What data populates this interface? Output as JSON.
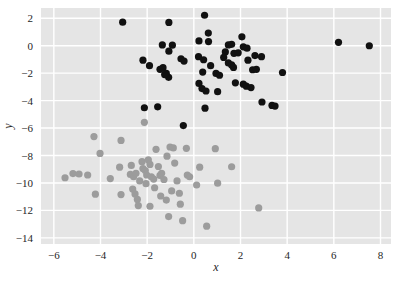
{
  "chart_data": {
    "type": "scatter",
    "title": "",
    "xlabel": "x",
    "ylabel": "y",
    "xlim": [
      -6.55,
      8.45
    ],
    "ylim": [
      -14.45,
      2.75
    ],
    "xticks": [
      -6,
      -4,
      -2,
      0,
      2,
      4,
      6,
      8
    ],
    "xticklabels": [
      "−6",
      "−4",
      "−2",
      "0",
      "2",
      "4",
      "6",
      "8"
    ],
    "yticks": [
      2,
      0,
      -2,
      -4,
      -6,
      -8,
      -10,
      -12,
      -14
    ],
    "yticklabels": [
      "2",
      "0",
      "−2",
      "−4",
      "−6",
      "−8",
      "−10",
      "−12",
      "−14"
    ],
    "grid": true,
    "grid_color": "#ffffff",
    "axes_facecolor": "#e5e5e5",
    "figure_facecolor": "#ffffff",
    "legend": null,
    "marker_size": 7.2,
    "series": [
      {
        "name": "cluster-black",
        "color": "#111111",
        "marker": "o",
        "points": [
          [
            -3.05,
            1.72
          ],
          [
            -1.07,
            1.7
          ],
          [
            0.46,
            2.22
          ],
          [
            0.62,
            0.92
          ],
          [
            -1.35,
            0.06
          ],
          [
            -0.92,
            0.04
          ],
          [
            0.22,
            0.35
          ],
          [
            0.63,
            0.3
          ],
          [
            2.06,
            0.65
          ],
          [
            1.48,
            0.06
          ],
          [
            1.62,
            0.1
          ],
          [
            2.12,
            -0.08
          ],
          [
            2.28,
            -0.18
          ],
          [
            6.2,
            0.25
          ],
          [
            7.52,
            0.0
          ],
          [
            -1.07,
            -0.4
          ],
          [
            -2.18,
            -1.05
          ],
          [
            0.2,
            -0.8
          ],
          [
            0.42,
            -1.02
          ],
          [
            1.35,
            -0.45
          ],
          [
            1.72,
            -0.55
          ],
          [
            1.9,
            -0.52
          ],
          [
            2.62,
            -0.72
          ],
          [
            2.9,
            -0.8
          ],
          [
            -1.9,
            -1.45
          ],
          [
            -1.45,
            -1.72
          ],
          [
            -1.32,
            -1.6
          ],
          [
            -1.18,
            -2.02
          ],
          [
            -1.08,
            -2.3
          ],
          [
            -0.55,
            -0.95
          ],
          [
            -0.42,
            -1.12
          ],
          [
            1.48,
            -1.25
          ],
          [
            1.62,
            -1.4
          ],
          [
            1.7,
            -1.58
          ],
          [
            2.52,
            -1.75
          ],
          [
            2.68,
            -1.72
          ],
          [
            0.38,
            -1.92
          ],
          [
            0.95,
            -2.02
          ],
          [
            1.1,
            -2.15
          ],
          [
            3.8,
            -1.95
          ],
          [
            0.22,
            -2.75
          ],
          [
            0.35,
            -3.12
          ],
          [
            0.52,
            -3.3
          ],
          [
            1.02,
            -3.35
          ],
          [
            1.78,
            -2.7
          ],
          [
            2.12,
            -2.8
          ],
          [
            2.25,
            -2.95
          ],
          [
            2.45,
            -3.05
          ],
          [
            2.92,
            -4.1
          ],
          [
            3.35,
            -4.35
          ],
          [
            3.48,
            -4.4
          ],
          [
            -2.12,
            -4.52
          ],
          [
            -1.55,
            -4.45
          ],
          [
            0.48,
            -4.55
          ],
          [
            -0.45,
            -5.82
          ],
          [
            0.72,
            -1.45
          ],
          [
            1.28,
            -0.85
          ],
          [
            2.32,
            -1.05
          ],
          [
            -1.25,
            -2.1
          ]
        ]
      },
      {
        "name": "cluster-gray",
        "color": "#9c9c9c",
        "marker": "o",
        "points": [
          [
            -5.52,
            -9.62
          ],
          [
            -5.18,
            -9.32
          ],
          [
            -4.92,
            -9.35
          ],
          [
            -4.55,
            -9.42
          ],
          [
            -4.28,
            -6.62
          ],
          [
            -4.02,
            -7.85
          ],
          [
            -4.22,
            -10.82
          ],
          [
            -3.58,
            -9.68
          ],
          [
            -3.12,
            -6.9
          ],
          [
            -3.18,
            -8.85
          ],
          [
            -3.12,
            -10.85
          ],
          [
            -2.72,
            -9.38
          ],
          [
            -2.58,
            -9.55
          ],
          [
            -2.48,
            -9.3
          ],
          [
            -2.62,
            -10.45
          ],
          [
            -2.52,
            -10.8
          ],
          [
            -2.42,
            -11.2
          ],
          [
            -2.38,
            -11.65
          ],
          [
            -2.22,
            -8.45
          ],
          [
            -2.18,
            -8.95
          ],
          [
            -2.08,
            -9.1
          ],
          [
            -2.02,
            -9.42
          ],
          [
            -2.12,
            -5.58
          ],
          [
            -1.95,
            -8.32
          ],
          [
            -1.88,
            -8.65
          ],
          [
            -1.82,
            -9.55
          ],
          [
            -1.72,
            -9.72
          ],
          [
            -1.88,
            -11.7
          ],
          [
            -1.62,
            -7.55
          ],
          [
            -1.52,
            -8.8
          ],
          [
            -1.45,
            -9.45
          ],
          [
            -1.38,
            -9.3
          ],
          [
            -1.28,
            -9.75
          ],
          [
            -1.18,
            -11.25
          ],
          [
            -1.08,
            -12.45
          ],
          [
            -1.02,
            -7.38
          ],
          [
            -0.88,
            -7.45
          ],
          [
            -0.82,
            -8.55
          ],
          [
            -0.72,
            -9.85
          ],
          [
            -0.62,
            -10.75
          ],
          [
            -0.58,
            -11.55
          ],
          [
            -0.48,
            -12.75
          ],
          [
            -0.32,
            -7.48
          ],
          [
            -0.28,
            -9.42
          ],
          [
            -0.18,
            -9.55
          ],
          [
            0.12,
            -10.15
          ],
          [
            0.25,
            -8.85
          ],
          [
            0.55,
            -13.15
          ],
          [
            0.92,
            -7.5
          ],
          [
            1.02,
            -10.02
          ],
          [
            1.62,
            -8.82
          ],
          [
            2.78,
            -11.82
          ],
          [
            -1.68,
            -10.35
          ],
          [
            -2.32,
            -9.85
          ],
          [
            -0.95,
            -10.58
          ],
          [
            -1.15,
            -8.05
          ],
          [
            -2.05,
            -10.05
          ],
          [
            -2.68,
            -8.72
          ],
          [
            -1.42,
            -10.95
          ]
        ]
      }
    ]
  },
  "axes": {
    "x_axis_name": "x-axis",
    "y_axis_name": "y-axis"
  }
}
